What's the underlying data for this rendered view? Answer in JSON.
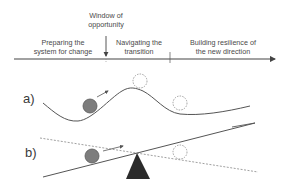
{
  "timeline": {
    "window_label_line1": "Window of",
    "window_label_line2": "opportunity",
    "phases": [
      {
        "line1": "Preparing the",
        "line2": "system for change"
      },
      {
        "line1": "Navigating the",
        "line2": "transition"
      },
      {
        "line1": "Building resilience of",
        "line2": "the new direction"
      }
    ]
  },
  "panels": {
    "a": {
      "label": "a)"
    },
    "b": {
      "label": "b)"
    }
  },
  "colors": {
    "line": "#555555",
    "ball_fill": "#7d7d7d",
    "ball_stroke": "#5a5a5a",
    "ghost_ball": "#8a8a8a",
    "fulcrum": "#2b2b2b"
  }
}
